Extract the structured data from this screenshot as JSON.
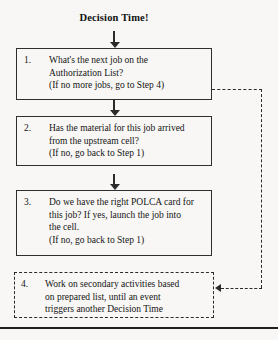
{
  "diagram": {
    "title": "Decision Time!",
    "steps": [
      {
        "number": "1.",
        "lines": [
          "What's the next job on the",
          "Authorization List?",
          "(If no more jobs, go to Step 4)"
        ],
        "border_style": "solid"
      },
      {
        "number": "2.",
        "lines": [
          "Has the material for this job arrived",
          "from the upstream cell?",
          "(If no, go back to Step 1)"
        ],
        "border_style": "solid"
      },
      {
        "number": "3.",
        "lines": [
          "Do we have the right POLCA card for",
          "this job? If yes, launch the job into",
          "the cell.",
          "(If no, go back to Step 1)"
        ],
        "border_style": "solid"
      },
      {
        "number": "4.",
        "lines": [
          "Work on secondary activities based",
          "on prepared list, until an event",
          "triggers another Decision Time"
        ],
        "border_style": "dashed"
      }
    ],
    "connectors": {
      "entry_arrow": "down-arrow-icon",
      "step1_to_step2_arrow": "down-arrow-icon",
      "step2_to_step3_arrow": "down-arrow-icon",
      "feedback_arrow": "left-arrow-icon"
    },
    "colors": {
      "ink": "#1a1a1a",
      "border": "#2e2e2e",
      "dashed_border": "#2b2b2b",
      "background": "#f8f7f5",
      "rule": "#202020"
    }
  }
}
